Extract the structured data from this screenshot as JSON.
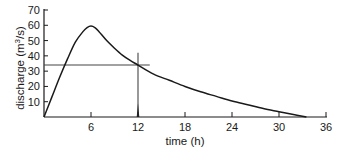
{
  "chart_data": {
    "type": "line",
    "title": "",
    "xlabel": "time (h)",
    "ylabel": "discharge (m³/s)",
    "ylabel_base": "discharge (m",
    "ylabel_sup": "3",
    "ylabel_tail": "/s)",
    "xlim": [
      0,
      36
    ],
    "ylim": [
      0,
      70
    ],
    "grid": false,
    "legend": null,
    "x_ticks": [
      6,
      12,
      18,
      24,
      30,
      36
    ],
    "x_tick_labels": [
      "6",
      "12",
      "18",
      "24",
      "30",
      "36"
    ],
    "y_ticks": [
      10,
      20,
      30,
      40,
      50,
      60,
      70
    ],
    "y_tick_labels": [
      "10",
      "20",
      "30",
      "40",
      "50",
      "60",
      "70"
    ],
    "series": [
      {
        "name": "hydrograph",
        "x": [
          0,
          1,
          2,
          3,
          4,
          5,
          5.5,
          6,
          6.5,
          7,
          8,
          9,
          10,
          11,
          12,
          14,
          16,
          18,
          20,
          22,
          24,
          26,
          28,
          30,
          32,
          33.5
        ],
        "y": [
          0,
          13,
          26,
          38,
          49,
          56,
          58.5,
          59.5,
          58.5,
          56,
          50,
          45,
          40.5,
          37,
          34,
          28,
          24,
          20,
          16.5,
          13.5,
          10.5,
          8,
          5.5,
          3.5,
          1.5,
          0
        ]
      }
    ],
    "annotations": [
      {
        "type": "hline",
        "y": 34,
        "x_from": 0,
        "x_to": 13.5,
        "note": "discharge level read-off line"
      },
      {
        "type": "vline",
        "x": 12,
        "y_from": 0,
        "y_to": 42,
        "note": "time marker at 12 h"
      }
    ]
  }
}
